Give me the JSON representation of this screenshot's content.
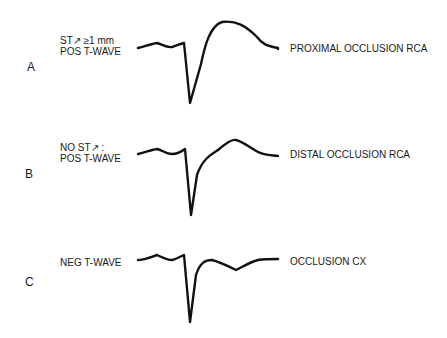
{
  "figure": {
    "panels": [
      {
        "letter": "A",
        "condition_lines": [
          "ST↗ ≥1 mm",
          "POS T-WAVE"
        ],
        "diagnosis": "PROXIMAL OCCLUSION RCA",
        "st_segment": "elevated",
        "t_wave": "positive"
      },
      {
        "letter": "B",
        "condition_lines": [
          "NO ST↗ :",
          "POS T-WAVE"
        ],
        "diagnosis": "DISTAL OCCLUSION RCA",
        "st_segment": "not elevated",
        "t_wave": "positive"
      },
      {
        "letter": "C",
        "condition_lines": [
          "NEG T-WAVE"
        ],
        "diagnosis": "OCCLUSION CX",
        "st_segment": "not elevated",
        "t_wave": "negative"
      }
    ],
    "trace_color": "#111111"
  }
}
